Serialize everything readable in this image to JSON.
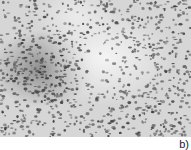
{
  "figure": {
    "panel_label": "b)",
    "image_description": "Grayscale micrograph showing densely scattered dark cell nuclei, with a darker dense cluster on the left-center and a lighter region in the center-top",
    "colors": {
      "background": "#d8d8d8",
      "light_region": "#f2f2f2",
      "dark_speckle": "#2a2a2a",
      "mid_speckle": "#707070"
    }
  }
}
